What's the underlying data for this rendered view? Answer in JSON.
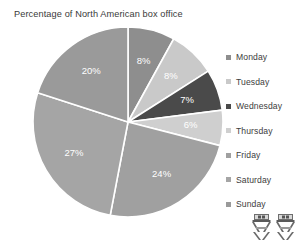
{
  "chart_data": {
    "type": "pie",
    "title": "Percentage of North American box office",
    "xlabel": "",
    "ylabel": "",
    "legend_position": "right",
    "grid": false,
    "start_angle_deg": 0,
    "direction": "clockwise",
    "categories": [
      "Monday",
      "Tuesday",
      "Wednesday",
      "Thursday",
      "Friday",
      "Saturday",
      "Sunday"
    ],
    "values": [
      8,
      8,
      7,
      6,
      24,
      27,
      20
    ],
    "value_labels": [
      "8%",
      "8%",
      "7%",
      "6%",
      "24%",
      "27%",
      "20%"
    ],
    "colors": [
      "#8e8e8e",
      "#c9c9c9",
      "#4a4a4a",
      "#cfcfcf",
      "#a0a0a0",
      "#a5a5a5",
      "#9a9a9a"
    ],
    "slice_separator_color": "#ffffff",
    "total": 100
  },
  "legend": {
    "items": [
      {
        "label": "Monday",
        "color": "#8e8e8e"
      },
      {
        "label": "Tuesday",
        "color": "#c9c9c9"
      },
      {
        "label": "Wednesday",
        "color": "#4a4a4a"
      },
      {
        "label": "Thursday",
        "color": "#cfcfcf"
      },
      {
        "label": "Friday",
        "color": "#a0a0a0"
      },
      {
        "label": "Saturday",
        "color": "#a5a5a5"
      },
      {
        "label": "Sunday",
        "color": "#9a9a9a"
      }
    ]
  },
  "decoration": {
    "icons": [
      "director-chair-icon",
      "director-chair-icon"
    ]
  }
}
